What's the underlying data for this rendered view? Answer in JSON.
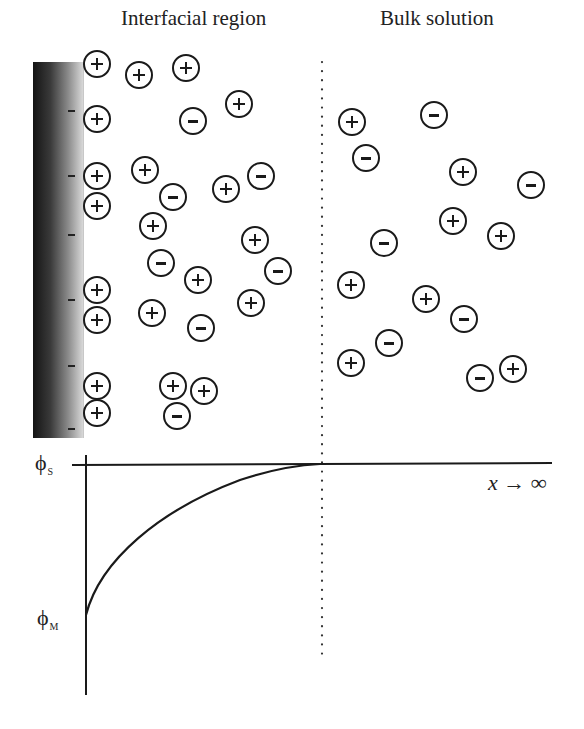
{
  "headings": {
    "interfacial": "Interfacial region",
    "bulk": "Bulk solution"
  },
  "axis": {
    "phi_s_symbol": "ϕ",
    "phi_s_sub": "S",
    "phi_m_symbol": "ϕ",
    "phi_m_sub": "M",
    "x_label": "x → ∞"
  },
  "electrode_charges": [
    {
      "x": 40,
      "y": 48
    },
    {
      "x": 40,
      "y": 113
    },
    {
      "x": 40,
      "y": 172
    },
    {
      "x": 40,
      "y": 237
    },
    {
      "x": 40,
      "y": 303
    },
    {
      "x": 40,
      "y": 366
    }
  ],
  "ions": [
    {
      "x": 96,
      "y": 63,
      "charge": "+"
    },
    {
      "x": 138,
      "y": 74,
      "charge": "+"
    },
    {
      "x": 185,
      "y": 67,
      "charge": "+"
    },
    {
      "x": 96,
      "y": 118,
      "charge": "+"
    },
    {
      "x": 192,
      "y": 120,
      "charge": "-"
    },
    {
      "x": 238,
      "y": 103,
      "charge": "+"
    },
    {
      "x": 96,
      "y": 175,
      "charge": "+"
    },
    {
      "x": 144,
      "y": 169,
      "charge": "+"
    },
    {
      "x": 172,
      "y": 196,
      "charge": "-"
    },
    {
      "x": 225,
      "y": 188,
      "charge": "+"
    },
    {
      "x": 260,
      "y": 175,
      "charge": "-"
    },
    {
      "x": 96,
      "y": 205,
      "charge": "+"
    },
    {
      "x": 152,
      "y": 225,
      "charge": "+"
    },
    {
      "x": 254,
      "y": 239,
      "charge": "+"
    },
    {
      "x": 160,
      "y": 262,
      "charge": "-"
    },
    {
      "x": 96,
      "y": 289,
      "charge": "+"
    },
    {
      "x": 197,
      "y": 279,
      "charge": "+"
    },
    {
      "x": 277,
      "y": 270,
      "charge": "-"
    },
    {
      "x": 96,
      "y": 319,
      "charge": "+"
    },
    {
      "x": 151,
      "y": 312,
      "charge": "+"
    },
    {
      "x": 250,
      "y": 302,
      "charge": "+"
    },
    {
      "x": 200,
      "y": 327,
      "charge": "-"
    },
    {
      "x": 96,
      "y": 385,
      "charge": "+"
    },
    {
      "x": 172,
      "y": 385,
      "charge": "+"
    },
    {
      "x": 203,
      "y": 390,
      "charge": "+"
    },
    {
      "x": 96,
      "y": 412,
      "charge": "+"
    },
    {
      "x": 176,
      "y": 415,
      "charge": "-"
    },
    {
      "x": 351,
      "y": 121,
      "charge": "+"
    },
    {
      "x": 433,
      "y": 114,
      "charge": "-"
    },
    {
      "x": 365,
      "y": 157,
      "charge": "-"
    },
    {
      "x": 462,
      "y": 171,
      "charge": "+"
    },
    {
      "x": 530,
      "y": 184,
      "charge": "-"
    },
    {
      "x": 452,
      "y": 220,
      "charge": "+"
    },
    {
      "x": 383,
      "y": 242,
      "charge": "-"
    },
    {
      "x": 500,
      "y": 235,
      "charge": "+"
    },
    {
      "x": 350,
      "y": 284,
      "charge": "+"
    },
    {
      "x": 425,
      "y": 298,
      "charge": "+"
    },
    {
      "x": 463,
      "y": 318,
      "charge": "-"
    },
    {
      "x": 388,
      "y": 342,
      "charge": "-"
    },
    {
      "x": 350,
      "y": 362,
      "charge": "+"
    },
    {
      "x": 479,
      "y": 377,
      "charge": "-"
    },
    {
      "x": 512,
      "y": 368,
      "charge": "+"
    }
  ]
}
